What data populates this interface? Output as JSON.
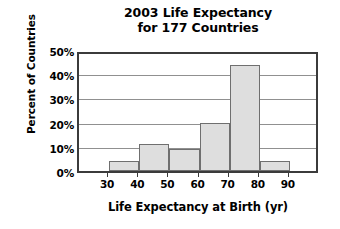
{
  "chart_data": {
    "type": "bar",
    "title": "2003 Life Expectancy for 177 Countries",
    "title_lines": [
      "2003 Life Expectancy",
      "for 177 Countries"
    ],
    "xlabel": "Life Expectancy at Birth (yr)",
    "ylabel": "Percent of Countries",
    "categories": [
      "30-40",
      "40-50",
      "50-60",
      "60-70",
      "70-80",
      "80-90"
    ],
    "bin_edges": [
      30,
      40,
      50,
      60,
      70,
      80,
      90
    ],
    "values": [
      4,
      11,
      9,
      20,
      44,
      4
    ],
    "xlim": [
      20,
      100
    ],
    "ylim": [
      0,
      50
    ],
    "ytick_labels": [
      "0%",
      "10%",
      "20%",
      "30%",
      "40%",
      "50%"
    ],
    "ytick_values": [
      0,
      10,
      20,
      30,
      40,
      50
    ],
    "xtick_labels": [
      "30",
      "40",
      "50",
      "60",
      "70",
      "80",
      "90"
    ],
    "xtick_values": [
      30,
      40,
      50,
      60,
      70,
      80,
      90
    ],
    "grid": true,
    "legend": false,
    "bar_fill_color": "#dedede",
    "bar_edge_color": "#6f6f6f",
    "frame_color": "#3b3b3b",
    "gridline_color": "#909090",
    "background_color": "#ffffff"
  }
}
